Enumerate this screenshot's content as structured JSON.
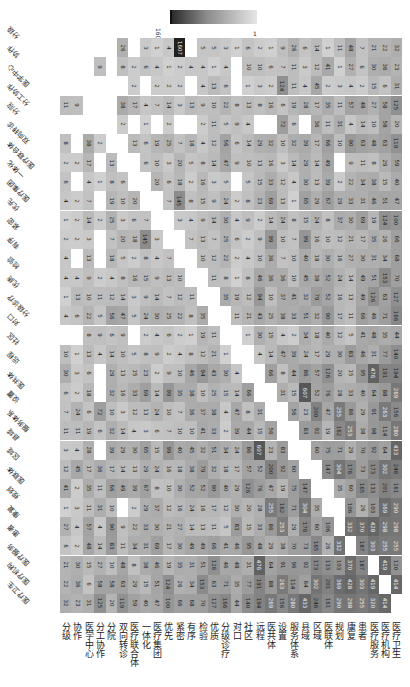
{
  "chart_data": {
    "type": "heatmap",
    "title": "",
    "note": "Symmetric keyword co-occurrence matrix rendered rotated 90 degrees; diagonal left blank.",
    "colorbar": {
      "max_label": "1607",
      "min_label": "1",
      "colors": [
        "#2b2b2b",
        "#e6e6e6"
      ]
    },
    "labels": [
      "分级",
      "协作",
      "医学中心",
      "分工协作",
      "分院",
      "双向转诊",
      "医疗联合体",
      "一体化",
      "医疗集团",
      "优先",
      "紧密",
      "有序",
      "检验",
      "优质",
      "分级诊疗",
      "对口",
      "社区",
      "远程",
      "医共体",
      "设置",
      "服务体系",
      "县域",
      "区域",
      "医联体",
      "规划",
      "康复",
      "患者",
      "医疗服务",
      "医疗机构",
      "医疗卫生"
    ],
    "rows": [
      {
        "label": "分级",
        "values": [
          null,
          0,
          0,
          0,
          0,
          26,
          0,
          3,
          1,
          4,
          1607,
          0,
          5,
          5,
          3,
          1,
          6,
          2,
          1,
          9,
          26,
          6,
          14,
          1,
          11,
          48,
          7,
          21,
          22,
          32
        ]
      },
      {
        "label": "协作",
        "values": [
          0,
          null,
          0,
          9,
          0,
          8,
          2,
          6,
          4,
          1,
          2,
          4,
          4,
          1,
          4,
          0,
          10,
          10,
          6,
          7,
          11,
          3,
          12,
          41,
          1,
          27,
          6,
          30,
          36,
          23
        ]
      },
      {
        "label": "医学中心",
        "values": [
          0,
          0,
          null,
          0,
          0,
          0,
          2,
          0,
          2,
          2,
          2,
          0,
          4,
          13,
          6,
          0,
          1,
          3,
          2,
          124,
          11,
          4,
          45,
          2,
          3,
          4,
          2,
          15,
          6,
          31
        ]
      },
      {
        "label": "分工协作",
        "values": [
          11,
          9,
          0,
          null,
          0,
          38,
          17,
          4,
          7,
          14,
          3,
          13,
          9,
          10,
          22,
          8,
          13,
          8,
          16,
          6,
          19,
          28,
          17,
          35,
          11,
          57,
          48,
          27,
          58,
          125
        ]
      },
      {
        "label": "分院",
        "values": [
          0,
          0,
          0,
          0,
          null,
          2,
          0,
          1,
          0,
          2,
          0,
          0,
          2,
          11,
          5,
          9,
          4,
          0,
          0,
          72,
          6,
          0,
          36,
          11,
          31,
          4,
          14,
          10,
          58,
          20
        ]
      },
      {
        "label": "双向转诊",
        "values": [
          8,
          0,
          38,
          2,
          0,
          null,
          13,
          6,
          19,
          25,
          7,
          18,
          4,
          12,
          56,
          6,
          14,
          29,
          32,
          10,
          32,
          39,
          17,
          66,
          10,
          90,
          63,
          48,
          63,
          119
        ]
      },
      {
        "label": "医疗联合体",
        "values": [
          2,
          2,
          17,
          0,
          13,
          0,
          null,
          6,
          10,
          3,
          20,
          5,
          8,
          14,
          47,
          9,
          10,
          13,
          16,
          3,
          14,
          29,
          14,
          49,
          0,
          9,
          11,
          8,
          29,
          59
        ]
      },
      {
        "label": "一体化",
        "values": [
          6,
          0,
          4,
          1,
          8,
          6,
          0,
          null,
          20,
          6,
          18,
          2,
          16,
          3,
          5,
          0,
          5,
          15,
          33,
          12,
          4,
          30,
          13,
          39,
          2,
          22,
          34,
          38,
          15,
          40
        ]
      },
      {
        "label": "医疗集团",
        "values": [
          4,
          2,
          7,
          0,
          19,
          10,
          20,
          0,
          null,
          7,
          145,
          8,
          15,
          9,
          24,
          2,
          8,
          23,
          69,
          13,
          1,
          65,
          29,
          67,
          29,
          33,
          31,
          46,
          51,
          47
        ]
      },
      {
        "label": "优先",
        "values": [
          1,
          2,
          14,
          2,
          25,
          3,
          6,
          7,
          0,
          null,
          3,
          4,
          9,
          14,
          30,
          4,
          9,
          2,
          14,
          24,
          8,
          15,
          24,
          8,
          37,
          30,
          69,
          19,
          124,
          100
        ]
      },
      {
        "label": "紧密",
        "values": [
          2,
          2,
          3,
          0,
          7,
          20,
          18,
          145,
          3,
          0,
          null,
          7,
          13,
          7,
          25,
          6,
          2,
          9,
          99,
          10,
          7,
          99,
          16,
          10,
          12,
          21,
          17,
          35,
          26,
          66
        ]
      },
      {
        "label": "有序",
        "values": [
          4,
          0,
          13,
          0,
          18,
          5,
          2,
          8,
          4,
          7,
          0,
          null,
          10,
          12,
          22,
          2,
          4,
          10,
          36,
          7,
          10,
          40,
          18,
          30,
          16,
          27,
          30,
          31,
          34,
          68
        ]
      },
      {
        "label": "检验",
        "values": [
          4,
          4,
          9,
          2,
          4,
          8,
          16,
          15,
          9,
          13,
          10,
          0,
          null,
          11,
          8,
          1,
          8,
          46,
          36,
          36,
          10,
          45,
          38,
          52,
          24,
          14,
          49,
          51,
          153,
          70
        ]
      },
      {
        "label": "优质",
        "values": [
          1,
          13,
          10,
          11,
          12,
          14,
          3,
          9,
          14,
          7,
          12,
          11,
          0,
          null,
          35,
          19,
          12,
          94,
          10,
          37,
          41,
          32,
          79,
          52,
          16,
          13,
          49,
          126,
          63,
          127
        ]
      },
      {
        "label": "分级诊疗",
        "values": [
          4,
          6,
          22,
          5,
          56,
          47,
          5,
          24,
          30,
          25,
          22,
          8,
          35,
          0,
          null,
          11,
          21,
          43,
          25,
          38,
          33,
          51,
          32,
          90,
          17,
          11,
          66,
          46,
          71,
          166
        ]
      },
      {
        "label": "对口",
        "values": [
          0,
          0,
          8,
          9,
          6,
          9,
          0,
          2,
          4,
          6,
          2,
          1,
          19,
          11,
          0,
          null,
          1,
          30,
          15,
          4,
          2,
          34,
          18,
          40,
          12,
          5,
          41,
          48,
          35,
          44
        ]
      },
      {
        "label": "社区",
        "values": [
          10,
          1,
          13,
          4,
          14,
          10,
          5,
          8,
          9,
          2,
          4,
          8,
          12,
          21,
          1,
          0,
          null,
          4,
          14,
          47,
          39,
          24,
          17,
          29,
          30,
          83,
          46,
          31,
          77,
          140
        ]
      },
      {
        "label": "远程",
        "values": [
          30,
          3,
          6,
          0,
          29,
          13,
          15,
          23,
          2,
          9,
          10,
          46,
          94,
          43,
          30,
          4,
          0,
          null,
          66,
          8,
          44,
          86,
          57,
          126,
          20,
          15,
          95,
          476,
          191,
          194
        ]
      },
      {
        "label": "医共体",
        "values": [
          6,
          2,
          18,
          0,
          32,
          16,
          33,
          69,
          14,
          99,
          35,
          38,
          10,
          25,
          15,
          14,
          66,
          0,
          null,
          31,
          15,
          607,
          52,
          76,
          28,
          33,
          40,
          64,
          88,
          269
        ]
      },
      {
        "label": "设置",
        "values": [
          7,
          24,
          6,
          72,
          10,
          3,
          12,
          13,
          24,
          10,
          7,
          36,
          37,
          38,
          4,
          47,
          8,
          31,
          0,
          null,
          56,
          23,
          200,
          47,
          255,
          86,
          29,
          91,
          263,
          156
        ]
      },
      {
        "label": "服务体系",
        "values": [
          11,
          11,
          19,
          6,
          32,
          14,
          4,
          3,
          6,
          7,
          10,
          10,
          41,
          33,
          2,
          39,
          44,
          15,
          56,
          0,
          null,
          83,
          92,
          19,
          162,
          253,
          38,
          98,
          114,
          280
        ]
      },
      {
        "label": "县域",
        "values": [
          3,
          4,
          28,
          0,
          39,
          29,
          30,
          65,
          15,
          99,
          40,
          45,
          32,
          51,
          34,
          24,
          86,
          607,
          23,
          83,
          0,
          null,
          60,
          75,
          71,
          29,
          70,
          92,
          64,
          433
        ]
      },
      {
        "label": "区域",
        "values": [
          12,
          45,
          17,
          36,
          17,
          14,
          13,
          29,
          24,
          16,
          18,
          38,
          79,
          32,
          18,
          17,
          57,
          52,
          200,
          92,
          60,
          0,
          null,
          147,
          304,
          176,
          73,
          173,
          302,
          246
        ]
      },
      {
        "label": "医联体",
        "values": [
          41,
          2,
          35,
          11,
          66,
          49,
          39,
          67,
          8,
          10,
          30,
          52,
          52,
          90,
          40,
          29,
          126,
          76,
          47,
          19,
          75,
          147,
          0,
          null,
          35,
          60,
          165,
          133,
          201,
          161
        ]
      },
      {
        "label": "规划",
        "values": [
          1,
          3,
          11,
          31,
          10,
          0,
          2,
          29,
          37,
          12,
          16,
          24,
          16,
          17,
          12,
          30,
          20,
          28,
          255,
          162,
          71,
          304,
          35,
          0,
          null,
          106,
          26,
          103,
          369,
          290
        ]
      },
      {
        "label": "康复",
        "values": [
          27,
          4,
          57,
          4,
          90,
          9,
          22,
          33,
          30,
          21,
          27,
          14,
          13,
          11,
          5,
          83,
          15,
          33,
          86,
          253,
          29,
          176,
          60,
          106,
          null,
          332,
          370,
          428,
          298,
          298
        ]
      },
      {
        "label": "患者",
        "values": [
          6,
          2,
          48,
          14,
          83,
          11,
          34,
          31,
          69,
          17,
          30,
          49,
          49,
          66,
          41,
          46,
          95,
          48,
          29,
          38,
          70,
          73,
          165,
          26,
          332,
          null,
          187,
          303,
          255,
          255
        ]
      },
      {
        "label": "医疗服务",
        "values": [
          21,
          30,
          15,
          27,
          10,
          48,
          8,
          38,
          46,
          19,
          35,
          31,
          51,
          126,
          46,
          48,
          31,
          476,
          64,
          91,
          96,
          92,
          173,
          133,
          103,
          370,
          187,
          null,
          419,
          120
        ]
      },
      {
        "label": "医疗机构",
        "values": [
          22,
          36,
          6,
          58,
          58,
          63,
          29,
          15,
          51,
          124,
          26,
          34,
          153,
          63,
          71,
          35,
          77,
          191,
          88,
          263,
          114,
          64,
          302,
          201,
          369,
          428,
          303,
          419,
          null,
          414
        ]
      },
      {
        "label": "医疗卫生",
        "values": [
          32,
          23,
          31,
          125,
          20,
          119,
          59,
          40,
          47,
          100,
          66,
          68,
          70,
          127,
          166,
          44,
          140,
          194,
          269,
          156,
          280,
          433,
          246,
          161,
          290,
          298,
          255,
          320,
          414,
          null
        ]
      }
    ],
    "xlabel": "",
    "ylabel": "",
    "grid": false,
    "legend_position": "top (colorbar)"
  }
}
